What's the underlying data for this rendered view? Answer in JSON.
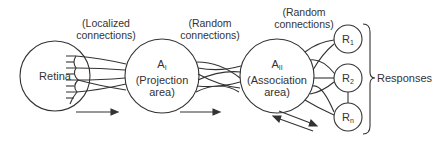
{
  "diagram": {
    "type": "perceptron-architecture",
    "nodes": {
      "retina": {
        "label": "Retina"
      },
      "projection": {
        "symbol": "A",
        "subscript": "I",
        "label": "(Projection",
        "label2": "area)"
      },
      "association": {
        "symbol": "A",
        "subscript": "II",
        "label": "(Association",
        "label2": "area)"
      },
      "r1": {
        "symbol": "R",
        "subscript": "1"
      },
      "r2": {
        "symbol": "R",
        "subscript": "2"
      },
      "rn": {
        "symbol": "R",
        "subscript": "n"
      }
    },
    "connection_labels": {
      "retina_to_projection": {
        "line1": "(Localized",
        "line2": "connections)"
      },
      "projection_to_association": {
        "line1": "(Random",
        "line2": "connections)"
      },
      "association_to_responses": {
        "line1": "(Random",
        "line2": "connections)"
      }
    },
    "responses_label": "Responses",
    "colors": {
      "stroke": "#333333",
      "background": "#ffffff"
    }
  }
}
